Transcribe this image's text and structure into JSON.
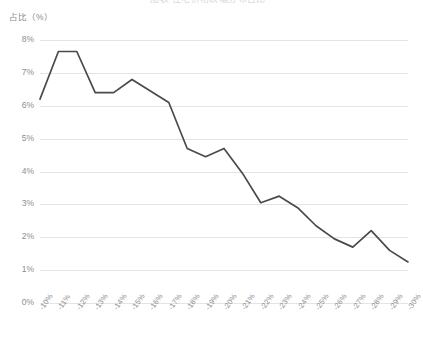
{
  "chart_title": "图表 住宅价格跌幅分布占比",
  "y_axis_title": "占比（%）",
  "axis": {
    "y_ticks": [
      "0%",
      "1%",
      "2%",
      "3%",
      "4%",
      "5%",
      "6%",
      "7%",
      "8%"
    ],
    "x_ticks": [
      "-10%",
      "-11%",
      "-12%",
      "-13%",
      "-14%",
      "-15%",
      "-16%",
      "-17%",
      "-18%",
      "-19%",
      "-20%",
      "-21%",
      "-22%",
      "-23%",
      "-24%",
      "-25%",
      "-26%",
      "-27%",
      "-28%",
      "-29%",
      "-30%"
    ]
  },
  "style": {
    "line_color": "#4a4a4a",
    "grid_color": "#e4e4e6",
    "text_color": "#8d8d91",
    "background": "#ffffff"
  },
  "chart_data": {
    "type": "line",
    "title": "图表 住宅价格跌幅分布占比",
    "xlabel": "",
    "ylabel": "占比（%）",
    "ylim": [
      0,
      8
    ],
    "grid": true,
    "legend": "none",
    "categories": [
      "-10%",
      "-11%",
      "-12%",
      "-13%",
      "-14%",
      "-15%",
      "-16%",
      "-17%",
      "-18%",
      "-19%",
      "-20%",
      "-21%",
      "-22%",
      "-23%",
      "-24%",
      "-25%",
      "-26%",
      "-27%",
      "-28%",
      "-29%",
      "-30%"
    ],
    "values": [
      6.2,
      7.65,
      7.65,
      6.4,
      6.4,
      6.8,
      6.45,
      6.1,
      4.7,
      4.45,
      4.7,
      3.95,
      3.05,
      3.25,
      2.9,
      2.35,
      1.95,
      1.7,
      2.2,
      1.6,
      1.25
    ],
    "y_tick_values": [
      0,
      1,
      2,
      3,
      4,
      5,
      6,
      7,
      8
    ]
  }
}
